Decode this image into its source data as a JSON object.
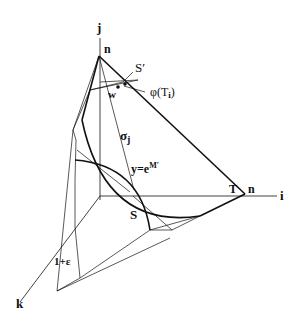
{
  "diagram": {
    "axes": {
      "i": "i",
      "j": "j",
      "k": "k"
    },
    "labels": {
      "n_top": "n",
      "n_right": "n",
      "S_prime": "S′",
      "w": "w",
      "phi_T": "φ(T",
      "phi_sub": "i",
      "phi_close": ")",
      "sigma": "σ",
      "sigma_sub": "j",
      "y_eq": "y=e",
      "y_sup": "M′",
      "T": "T",
      "S": "S",
      "one_plus_eps": "1+ε"
    },
    "colors": {
      "stroke": "#111111",
      "background": "#ffffff"
    }
  }
}
